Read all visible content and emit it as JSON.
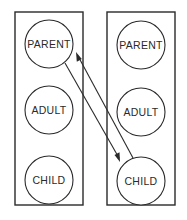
{
  "diagram": {
    "left_column": {
      "states": [
        {
          "label": "PARENT"
        },
        {
          "label": "ADULT"
        },
        {
          "label": "CHILD"
        }
      ]
    },
    "right_column": {
      "states": [
        {
          "label": "PARENT"
        },
        {
          "label": "ADULT"
        },
        {
          "label": "CHILD"
        }
      ]
    },
    "arrows": [
      {
        "from": "left.PARENT",
        "to": "right.CHILD"
      },
      {
        "from": "right.CHILD",
        "to": "left.PARENT"
      }
    ],
    "colors": {
      "ink": "#2a2a2a",
      "background": "#ffffff"
    }
  }
}
